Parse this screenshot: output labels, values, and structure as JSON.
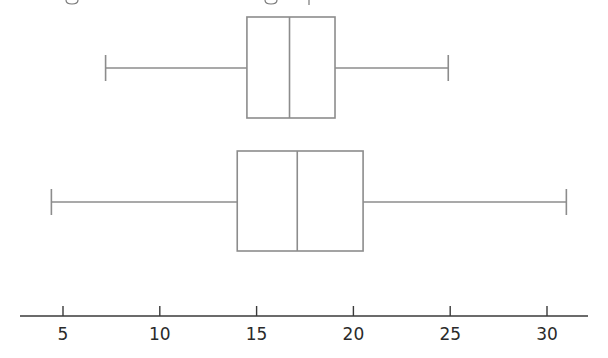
{
  "chart_data": {
    "type": "boxplot",
    "title": "",
    "xlabel": "",
    "ylabel": "",
    "orientation": "horizontal",
    "xlim": [
      2.0,
      31.8
    ],
    "ticks": [
      5,
      10,
      15,
      20,
      25,
      30
    ],
    "tick_labels": [
      "5",
      "10",
      "15",
      "20",
      "25",
      "30"
    ],
    "grid": false,
    "legend": null,
    "series": [
      {
        "name": "top",
        "min": 7.2,
        "q1": 14.5,
        "median": 16.7,
        "q3": 19.05,
        "max": 24.9
      },
      {
        "name": "bottom",
        "min": 4.4,
        "q1": 14.0,
        "median": 17.1,
        "q3": 20.5,
        "max": 31.0
      }
    ],
    "colors": {
      "box": "#8c8c8c",
      "axis": "#3a3a3a",
      "text": "#2a2a2a"
    }
  },
  "layout": {
    "x0_value": 5,
    "x0_px": 63,
    "px_per_unit": 19.36,
    "axis_y": 316,
    "axis_start_px": 20,
    "axis_end_px": 588,
    "rows": [
      {
        "center": 68,
        "top": 17,
        "bottom": 118,
        "cap_half": 13
      },
      {
        "center": 202,
        "top": 151,
        "bottom": 251,
        "cap_half": 13
      }
    ]
  }
}
